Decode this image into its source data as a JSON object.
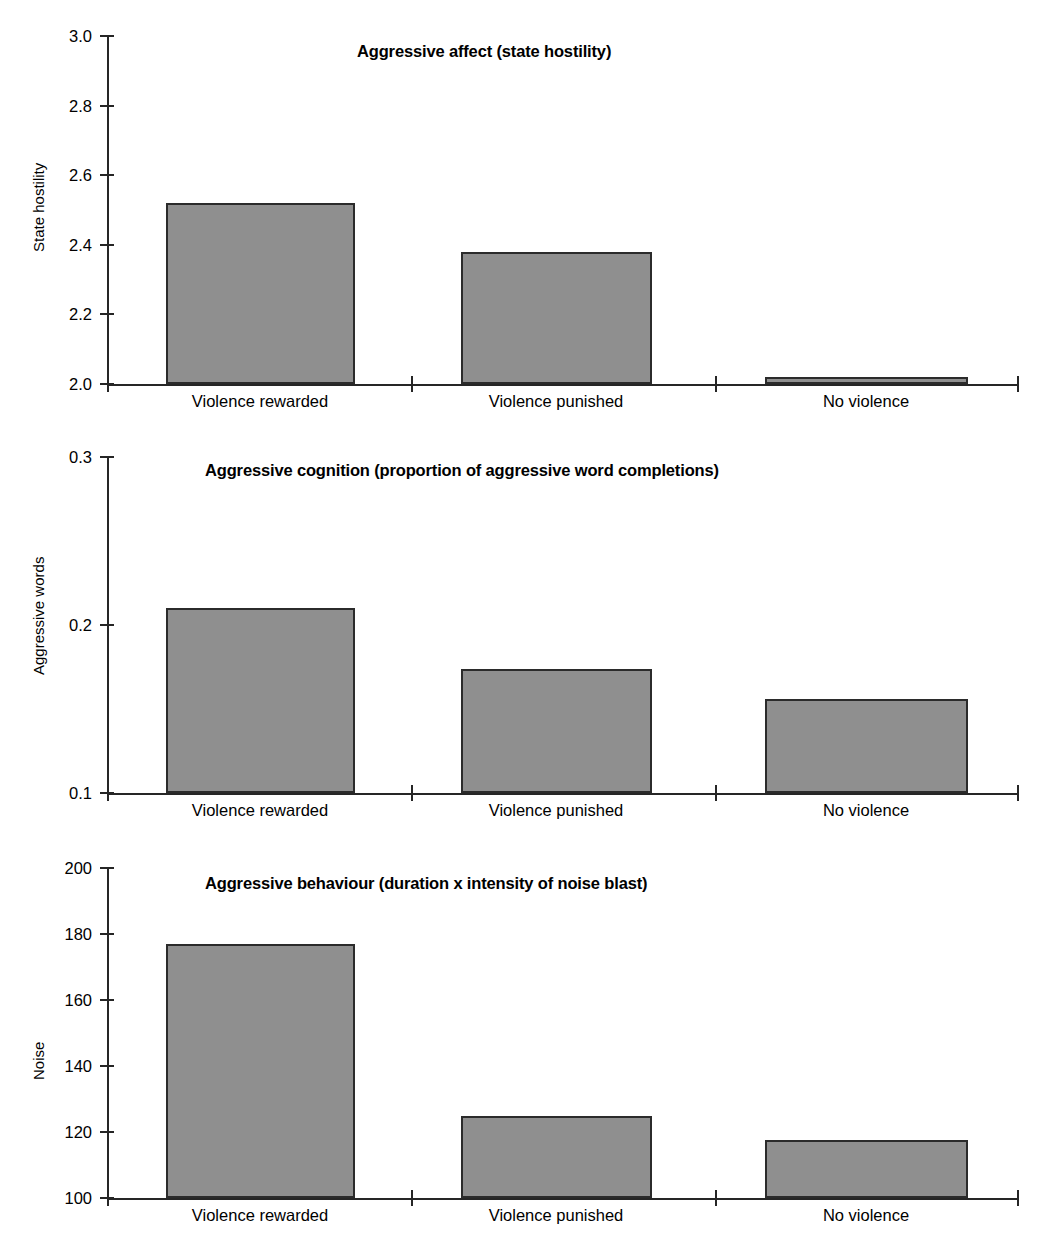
{
  "figure": {
    "background_color": "#ffffff",
    "bar_fill_color": "#8f8f8f",
    "bar_edge_color": "#2b2b2b",
    "axis_color": "#262626"
  },
  "chart_data": [
    {
      "type": "bar",
      "title": "Aggressive affect (state hostility)",
      "xlabel": "",
      "ylabel": "State hostility",
      "categories": [
        "Violence rewarded",
        "Violence punished",
        "No violence"
      ],
      "values": [
        2.52,
        2.38,
        2.02
      ],
      "ylim": [
        2.0,
        3.0
      ],
      "yticks": [
        2.0,
        2.2,
        2.4,
        2.6,
        2.8,
        3.0
      ],
      "ytick_labels": [
        "2.0",
        "2.2",
        "2.4",
        "2.6",
        "2.8",
        "3.0"
      ],
      "grid": false,
      "legend": "none"
    },
    {
      "type": "bar",
      "title": "Aggressive cognition (proportion of aggressive word completions)",
      "xlabel": "",
      "ylabel": "Aggressive words",
      "categories": [
        "Violence rewarded",
        "Violence punished",
        "No violence"
      ],
      "values": [
        0.21,
        0.174,
        0.156
      ],
      "ylim": [
        0.1,
        0.3
      ],
      "yticks": [
        0.1,
        0.2,
        0.3
      ],
      "ytick_labels": [
        "0.1",
        "0.2",
        "0.3"
      ],
      "grid": false,
      "legend": "none"
    },
    {
      "type": "bar",
      "title": "Aggressive behaviour (duration x intensity of noise blast)",
      "xlabel": "",
      "ylabel": "Noise",
      "categories": [
        "Violence rewarded",
        "Violence punished",
        "No violence"
      ],
      "values": [
        177,
        125,
        117.5
      ],
      "ylim": [
        100,
        200
      ],
      "yticks": [
        100,
        120,
        140,
        160,
        180,
        200
      ],
      "ytick_labels": [
        "100",
        "120",
        "140",
        "160",
        "180",
        "200"
      ],
      "grid": false,
      "legend": "none"
    }
  ]
}
